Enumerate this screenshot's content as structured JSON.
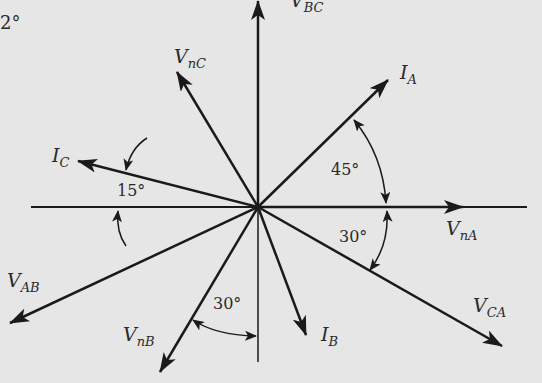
{
  "diagram": {
    "type": "phasor-diagram",
    "background": "#e6e6e6",
    "stroke_color": "#1a1a1a",
    "origin": {
      "x": 258,
      "y": 207
    },
    "axes": {
      "horizontal": {
        "x1": 31,
        "x2": 527,
        "y": 207
      },
      "vertical": {
        "x": 258,
        "y1": 0,
        "y2": 362
      }
    },
    "phasors": [
      {
        "id": "V_BC",
        "name": "V",
        "sub": "BC",
        "tip": {
          "x": 258,
          "y": 0
        },
        "label_pos": {
          "x": 290,
          "y": -9
        }
      },
      {
        "id": "V_nC",
        "name": "V",
        "sub": "nC",
        "tip": {
          "x": 177,
          "y": 72
        },
        "label_pos": {
          "x": 174,
          "y": 47
        }
      },
      {
        "id": "I_A",
        "name": "I",
        "sub": "A",
        "tip": {
          "x": 388,
          "y": 80
        },
        "label_pos": {
          "x": 400,
          "y": 63
        }
      },
      {
        "id": "I_C",
        "name": "I",
        "sub": "C",
        "tip": {
          "x": 78,
          "y": 161
        },
        "label_pos": {
          "x": 52,
          "y": 146
        }
      },
      {
        "id": "V_nA",
        "name": "V",
        "sub": "nA",
        "tip": {
          "x": 463,
          "y": 207
        },
        "label_pos": {
          "x": 446,
          "y": 219
        }
      },
      {
        "id": "V_AB",
        "name": "V",
        "sub": "AB",
        "tip": {
          "x": 10,
          "y": 323
        },
        "label_pos": {
          "x": 7,
          "y": 271
        }
      },
      {
        "id": "V_nB",
        "name": "V",
        "sub": "nB",
        "tip": {
          "x": 160,
          "y": 372
        },
        "label_pos": {
          "x": 123,
          "y": 325
        }
      },
      {
        "id": "I_B",
        "name": "I",
        "sub": "B",
        "tip": {
          "x": 306,
          "y": 335
        },
        "label_pos": {
          "x": 321,
          "y": 325
        }
      },
      {
        "id": "V_CA",
        "name": "V",
        "sub": "CA",
        "tip": {
          "x": 502,
          "y": 346
        },
        "label_pos": {
          "x": 473,
          "y": 296
        }
      }
    ],
    "angles": [
      {
        "id": "angle-IA-VnA",
        "text": "45°",
        "pos": {
          "x": 331,
          "y": 162
        }
      },
      {
        "id": "angle-VnA-VCA",
        "text": "30°",
        "pos": {
          "x": 339,
          "y": 229
        }
      },
      {
        "id": "angle-IC-axis",
        "text": "15°",
        "pos": {
          "x": 117,
          "y": 183
        }
      },
      {
        "id": "angle-VnB-axis",
        "text": "30°",
        "pos": {
          "x": 213,
          "y": 296
        }
      }
    ],
    "corner_fragment": "2°"
  }
}
